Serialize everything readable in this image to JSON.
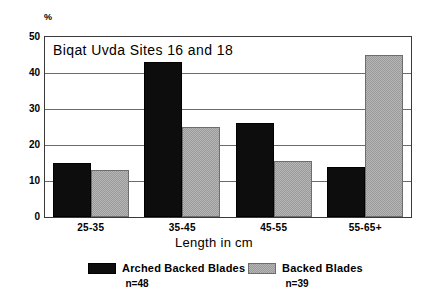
{
  "chart_data": {
    "type": "bar",
    "title": "Biqat Uvda Sites 16 and 18",
    "xlabel": "Length in cm",
    "ylabel": "%",
    "categories": [
      "25-35",
      "35-45",
      "45-55",
      "55-65+"
    ],
    "series": [
      {
        "name": "Arched Backed Blades",
        "n_label": "n=48",
        "color": "#0d0d0d",
        "values": [
          15,
          43,
          26,
          14
        ]
      },
      {
        "name": "Backed Blades",
        "n_label": "n=39",
        "color": "#9a9a9a",
        "values": [
          13,
          25,
          15.5,
          45
        ]
      }
    ],
    "ylim": [
      0,
      50
    ],
    "yticks": [
      0,
      10,
      20,
      30,
      40,
      50
    ],
    "ytick_labels": [
      "0",
      "10",
      "20",
      "30",
      "40",
      "50"
    ],
    "grid": true,
    "legend_position": "bottom"
  }
}
